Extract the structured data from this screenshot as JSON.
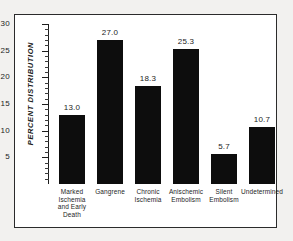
{
  "chart_data": {
    "type": "bar",
    "title": "",
    "xlabel": "",
    "ylabel": "PERCENT DISTRIBUTION",
    "ylim": [
      0,
      30
    ],
    "y_ticks": [
      30,
      25,
      20,
      15,
      10,
      5
    ],
    "minor_tick_interval": 1,
    "grid": false,
    "legend": "none",
    "bar_color": "#0d0d0d",
    "categories": [
      "Marked Ischemia and Early Death",
      "Gangrene",
      "Chronic Ischemia",
      "Anischemic Embolism",
      "Silent Embolism",
      "Undetermined"
    ],
    "category_label_lines": [
      [
        "Marked",
        "Ischemia",
        "and Early",
        "Death"
      ],
      [
        "Gangrene"
      ],
      [
        "Chronic",
        "Ischemia"
      ],
      [
        "Anischemic",
        "Embolism"
      ],
      [
        "Silent",
        "Embolism"
      ],
      [
        "Undetermined"
      ]
    ],
    "values": [
      13.0,
      27.0,
      18.3,
      25.3,
      5.7,
      10.7
    ],
    "value_labels": [
      "13.0",
      "27.0",
      "18.3",
      "25.3",
      "5.7",
      "10.7"
    ]
  },
  "axis": {
    "tick_0": "30",
    "tick_1": "25",
    "tick_2": "20",
    "tick_3": "15",
    "tick_4": "10",
    "tick_5": "5"
  }
}
